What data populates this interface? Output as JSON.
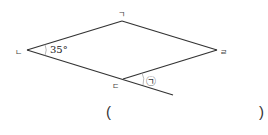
{
  "figure": {
    "shape": "rhombus",
    "vertices": {
      "top": {
        "label": "ㄱ",
        "x": 122,
        "y": 21
      },
      "left": {
        "label": "ㄴ",
        "x": 27,
        "y": 50
      },
      "bottom": {
        "label": "ㄷ",
        "x": 123,
        "y": 79
      },
      "right": {
        "label": "ㄹ",
        "x": 217,
        "y": 50
      }
    },
    "extension_end": {
      "x": 173,
      "y": 95
    },
    "angle_given": "35°",
    "angle_unknown_label": "㉠",
    "line_color": "#333333"
  },
  "answer": {
    "open_paren": "(",
    "close_paren": ")",
    "value": ""
  }
}
